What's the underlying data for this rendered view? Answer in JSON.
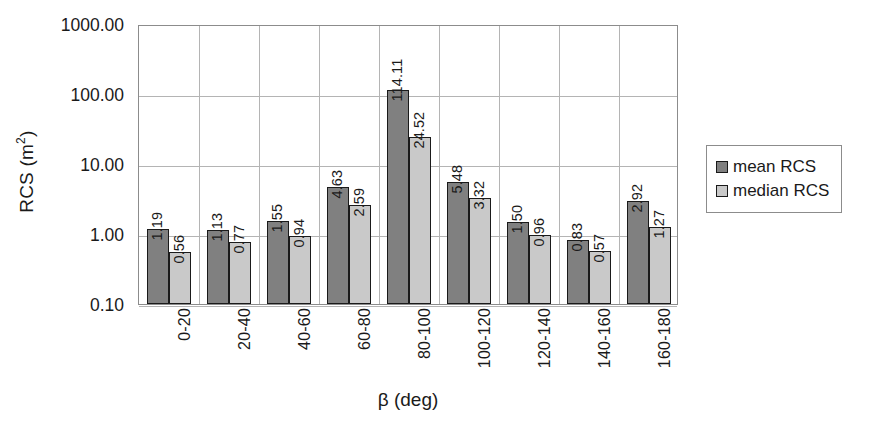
{
  "chart_data": {
    "type": "bar",
    "title": "",
    "xlabel": "β (deg)",
    "ylabel": "RCS (m²)",
    "ylabel_base": "RCS (m",
    "ylabel_sup": "2",
    "ylabel_tail": ")",
    "yscale": "log",
    "ylim": [
      0.1,
      1000.0
    ],
    "grid": "both",
    "legend_position": "right",
    "categories": [
      "0-20",
      "20-40",
      "40-60",
      "60-80",
      "80-100",
      "100-120",
      "120-140",
      "140-160",
      "160-180"
    ],
    "ytick_labels": [
      "1000.00",
      "100.00",
      "10.00",
      "1.00",
      "0.10"
    ],
    "ytick_values": [
      1000,
      100,
      10,
      1,
      0.1
    ],
    "series": [
      {
        "name": "mean RCS",
        "color": "#808080",
        "values": [
          1.19,
          1.13,
          1.55,
          4.63,
          114.11,
          5.48,
          1.5,
          0.83,
          2.92
        ],
        "labels": [
          "1.19",
          "1.13",
          "1.55",
          "4.63",
          "114.11",
          "5.48",
          "1.50",
          "0.83",
          "2.92"
        ]
      },
      {
        "name": "median RCS",
        "color": "#c9c9c9",
        "values": [
          0.56,
          0.77,
          0.94,
          2.59,
          24.52,
          3.32,
          0.96,
          0.57,
          1.27
        ],
        "labels": [
          "0.56",
          "0.77",
          "0.94",
          "2.59",
          "24.52",
          "3.32",
          "0.96",
          "0.57",
          "1.27"
        ]
      }
    ]
  },
  "legend": {
    "entries": [
      {
        "label": "mean RCS",
        "swatch": "mean"
      },
      {
        "label": "median RCS",
        "swatch": "median"
      }
    ]
  }
}
